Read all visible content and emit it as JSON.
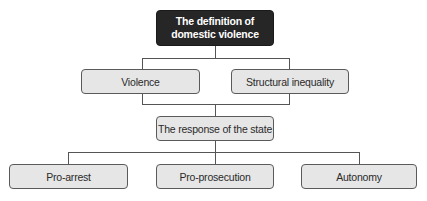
{
  "diagram": {
    "root": {
      "label": "The definition of\ndomestic violence"
    },
    "level1": [
      {
        "label": "Violence"
      },
      {
        "label": "Structural inequality"
      }
    ],
    "middle": {
      "label": "The response of the state"
    },
    "level2": [
      {
        "label": "Pro-arrest"
      },
      {
        "label": "Pro-prosecution"
      },
      {
        "label": "Autonomy"
      }
    ],
    "colors": {
      "root_fill": "#262626",
      "root_text": "#ffffff",
      "node_fill": "#e6e6e6",
      "node_border": "#5a5a5a",
      "connector": "#555555"
    }
  }
}
